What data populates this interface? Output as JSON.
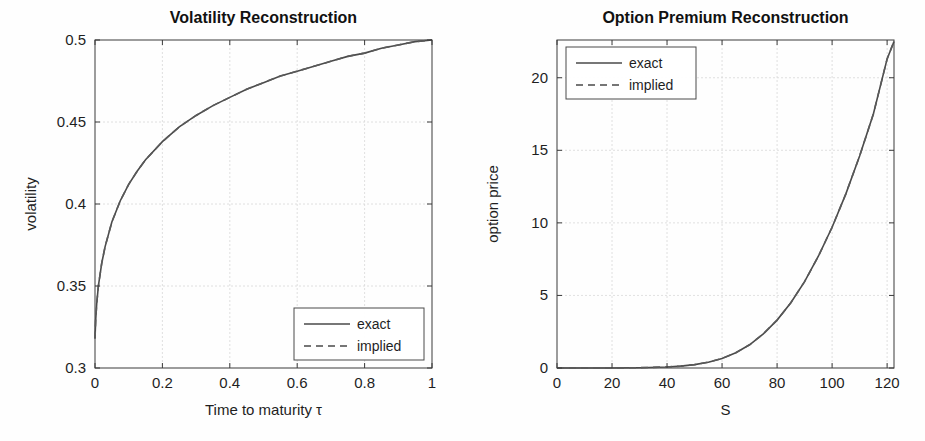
{
  "figure": {
    "background_color": "#fefefe",
    "panel_count": 2,
    "line_color": "#4a4a4a",
    "grid_color": "#d8d8d8",
    "axis_color": "#3a3a3a"
  },
  "chart_data": [
    {
      "id": "volatility-reconstruction",
      "type": "line",
      "title": "Volatility Reconstruction",
      "xlabel": "Time to maturity τ",
      "ylabel": "volatility",
      "xlim": [
        0,
        1
      ],
      "ylim": [
        0.3,
        0.5
      ],
      "xticks": [
        0,
        0.2,
        0.4,
        0.6,
        0.8,
        1
      ],
      "xtick_labels": [
        "0",
        "0.2",
        "0.4",
        "0.6",
        "0.8",
        "1"
      ],
      "yticks": [
        0.3,
        0.35,
        0.4,
        0.45,
        0.5
      ],
      "ytick_labels": [
        "0.3",
        "0.35",
        "0.4",
        "0.45",
        "0.5"
      ],
      "grid": true,
      "legend_position": "lower-right",
      "series": [
        {
          "name": "exact",
          "style": "solid",
          "x": [
            0,
            0.002,
            0.005,
            0.01,
            0.02,
            0.03,
            0.05,
            0.075,
            0.1,
            0.125,
            0.15,
            0.2,
            0.25,
            0.3,
            0.35,
            0.4,
            0.45,
            0.5,
            0.55,
            0.6,
            0.65,
            0.7,
            0.75,
            0.8,
            0.85,
            0.9,
            0.95,
            1.0
          ],
          "y": [
            0.318,
            0.329,
            0.339,
            0.35,
            0.364,
            0.374,
            0.389,
            0.402,
            0.412,
            0.42,
            0.427,
            0.438,
            0.447,
            0.454,
            0.46,
            0.465,
            0.47,
            0.474,
            0.478,
            0.481,
            0.484,
            0.487,
            0.49,
            0.492,
            0.495,
            0.497,
            0.499,
            0.5
          ]
        },
        {
          "name": "implied",
          "style": "dashed",
          "x": [
            0,
            0.002,
            0.005,
            0.01,
            0.02,
            0.03,
            0.05,
            0.075,
            0.1,
            0.125,
            0.15,
            0.2,
            0.25,
            0.3,
            0.35,
            0.4,
            0.45,
            0.5,
            0.55,
            0.6,
            0.65,
            0.7,
            0.75,
            0.8,
            0.85,
            0.9,
            0.95,
            1.0
          ],
          "y": [
            0.318,
            0.329,
            0.339,
            0.35,
            0.364,
            0.374,
            0.389,
            0.402,
            0.412,
            0.42,
            0.427,
            0.438,
            0.447,
            0.454,
            0.46,
            0.465,
            0.47,
            0.474,
            0.478,
            0.481,
            0.484,
            0.487,
            0.49,
            0.492,
            0.495,
            0.497,
            0.499,
            0.5
          ]
        }
      ],
      "legend": [
        {
          "label": "exact",
          "style": "solid"
        },
        {
          "label": "implied",
          "style": "dashed"
        }
      ]
    },
    {
      "id": "option-premium-reconstruction",
      "type": "line",
      "title": "Option Premium Reconstruction",
      "xlabel": "S",
      "ylabel": "option price",
      "xlim": [
        0,
        122.5
      ],
      "ylim": [
        0,
        22.6
      ],
      "xticks": [
        0,
        20,
        40,
        60,
        80,
        100,
        120
      ],
      "xtick_labels": [
        "0",
        "20",
        "40",
        "60",
        "80",
        "100",
        "120"
      ],
      "yticks": [
        0,
        5,
        10,
        15,
        20
      ],
      "ytick_labels": [
        "0",
        "5",
        "10",
        "15",
        "20"
      ],
      "grid": true,
      "legend_position": "upper-left",
      "series": [
        {
          "name": "exact",
          "style": "solid",
          "x": [
            0,
            10,
            20,
            30,
            40,
            45,
            50,
            55,
            60,
            65,
            70,
            75,
            80,
            85,
            90,
            95,
            100,
            105,
            110,
            115,
            120,
            122.5
          ],
          "y": [
            0.0,
            0.0,
            0.0,
            0.02,
            0.07,
            0.13,
            0.23,
            0.4,
            0.66,
            1.05,
            1.6,
            2.35,
            3.3,
            4.5,
            5.95,
            7.7,
            9.7,
            12.0,
            14.6,
            17.5,
            21.3,
            22.5
          ]
        },
        {
          "name": "implied",
          "style": "dashed",
          "x": [
            0,
            10,
            20,
            30,
            40,
            45,
            50,
            55,
            60,
            65,
            70,
            75,
            80,
            85,
            90,
            95,
            100,
            105,
            110,
            115,
            120,
            122.5
          ],
          "y": [
            0.0,
            0.0,
            0.0,
            0.02,
            0.07,
            0.13,
            0.23,
            0.4,
            0.66,
            1.05,
            1.6,
            2.35,
            3.3,
            4.5,
            5.95,
            7.7,
            9.7,
            12.0,
            14.6,
            17.5,
            21.3,
            22.5
          ]
        }
      ],
      "legend": [
        {
          "label": "exact",
          "style": "solid"
        },
        {
          "label": "implied",
          "style": "dashed"
        }
      ]
    }
  ]
}
